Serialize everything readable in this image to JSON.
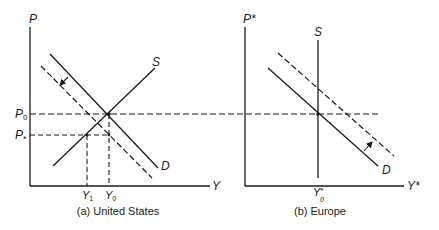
{
  "figure": {
    "panels": [
      {
        "id": "a",
        "caption": "(a) United States",
        "y_axis_label": "P",
        "x_axis_label": "Y",
        "curve_labels": {
          "supply": "S",
          "demand": "D"
        },
        "price_labels": {
          "p0": "P",
          "p0_sub": "0",
          "pstar": "P",
          "pstar_sub": "*"
        },
        "output_labels": {
          "y1": "Y",
          "y1_sub": "1",
          "y0": "Y",
          "y0_sub": "0"
        },
        "demand_shift": "left (dashed)"
      },
      {
        "id": "b",
        "caption": "(b) Europe",
        "y_axis_label": "P*",
        "x_axis_label": "Y*",
        "curve_labels": {
          "supply": "S",
          "demand": "D"
        },
        "output_labels": {
          "y0": "Y",
          "y0_sup": "*",
          "y0_sub": "0"
        },
        "demand_shift": "right (dashed)"
      }
    ],
    "colors": {
      "ink": "#1a1a1a",
      "background": "#ffffff"
    }
  }
}
